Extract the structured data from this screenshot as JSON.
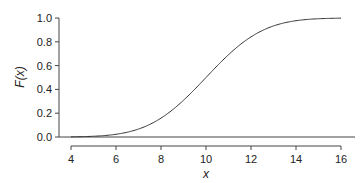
{
  "chart_data": {
    "type": "line",
    "title": "",
    "xlabel": "x",
    "ylabel": "F(x)",
    "xlim": [
      4,
      16
    ],
    "ylim": [
      0,
      1
    ],
    "xticks": [
      "4",
      "6",
      "8",
      "10",
      "12",
      "14",
      "16"
    ],
    "yticks": [
      "0.0",
      "0.2",
      "0.4",
      "0.6",
      "0.8",
      "1.0"
    ],
    "grid": false,
    "legend": null,
    "series": [
      {
        "name": "Normal CDF (mean 10, sd 2)",
        "x": [
          4,
          5,
          6,
          7,
          8,
          9,
          10,
          11,
          12,
          13,
          14,
          15,
          16
        ],
        "values": [
          0.001,
          0.006,
          0.023,
          0.067,
          0.159,
          0.309,
          0.5,
          0.691,
          0.841,
          0.933,
          0.977,
          0.994,
          0.999
        ]
      }
    ],
    "reference_line": {
      "y": 0,
      "style": "horizontal baseline"
    }
  }
}
